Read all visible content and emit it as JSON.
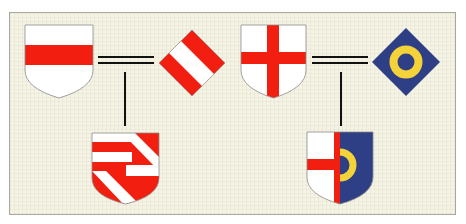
{
  "diagram": {
    "colors": {
      "background": "#f5f3e3",
      "frame": "#a8a89c",
      "argent": "#ffffff",
      "gules": "#f21e10",
      "azure": "#2f3f86",
      "or": "#f4d23a",
      "line": "#111111",
      "outline": "#8a8a8a"
    },
    "families": [
      {
        "id": "left",
        "father": {
          "shape": "shield",
          "blazon": "Argent, a fess gules"
        },
        "mother": {
          "shape": "lozenge",
          "blazon": "Gules, a bend argent"
        },
        "marriage_link": "double-line",
        "child": {
          "shape": "shield",
          "blazon": "Combined arms: fess and bend, counterchanged"
        }
      },
      {
        "id": "right",
        "father": {
          "shape": "shield",
          "blazon": "Argent, a cross gules"
        },
        "mother": {
          "shape": "lozenge",
          "blazon": "Azure, an annulet or"
        },
        "marriage_link": "double-line",
        "child": {
          "shape": "shield",
          "blazon": "Impaled: cross gules dexter, annulet or on azure sinister"
        }
      }
    ],
    "caption": ""
  }
}
